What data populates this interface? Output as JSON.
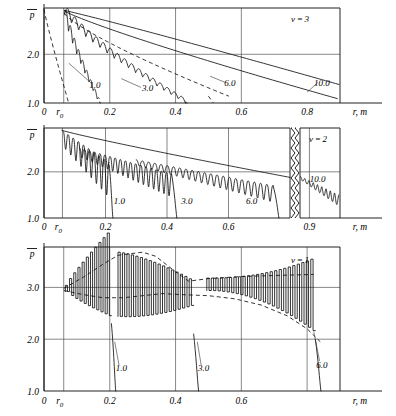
{
  "figure": {
    "type": "multi-panel-line-chart",
    "panel_count": 3,
    "shared_xlabel": "r, m",
    "shared_ylabel": "p"
  },
  "chart_data": [
    {
      "type": "line",
      "id": "panel-nu-3",
      "title": "",
      "annotation": "ν = 3",
      "xlabel": "r, m",
      "ylabel": "p",
      "xlim": [
        0,
        0.9
      ],
      "ylim": [
        1.0,
        2.9
      ],
      "grid": true,
      "legend": "inline-curve-labels",
      "xticks": [
        "0",
        "r₀",
        "0.2",
        "0.4",
        "0.6",
        "0.8"
      ],
      "xtick_values": [
        0,
        0.06,
        0.2,
        0.4,
        0.6,
        0.8
      ],
      "yticks": [
        "1.0",
        "2.0"
      ],
      "ytick_values": [
        1.0,
        2.0
      ],
      "series": [
        {
          "name": "1.0",
          "label": "1.0",
          "style": "solid-oscillating",
          "x": [
            0.06,
            0.07,
            0.08,
            0.09,
            0.1,
            0.11,
            0.12,
            0.13,
            0.14,
            0.15,
            0.16,
            0.17
          ],
          "values": [
            2.88,
            2.55,
            2.32,
            2.12,
            1.95,
            1.8,
            1.68,
            1.55,
            1.44,
            1.32,
            1.18,
            1.0
          ]
        },
        {
          "name": "3.0",
          "label": "3.0",
          "style": "solid-oscillating",
          "x": [
            0.06,
            0.1,
            0.14,
            0.18,
            0.22,
            0.26,
            0.3,
            0.34,
            0.38,
            0.42
          ],
          "values": [
            2.88,
            2.52,
            2.22,
            1.95,
            1.72,
            1.55,
            1.4,
            1.28,
            1.15,
            1.0
          ]
        },
        {
          "name": "6.0",
          "label": "6.0",
          "style": "solid",
          "x": [
            0.06,
            0.1,
            0.2,
            0.3,
            0.4,
            0.5,
            0.6,
            0.7,
            0.8,
            0.88
          ],
          "values": [
            2.88,
            2.72,
            2.46,
            2.2,
            1.96,
            1.73,
            1.52,
            1.34,
            1.18,
            1.05
          ]
        },
        {
          "name": "10.0",
          "label": "10.0",
          "style": "solid",
          "x": [
            0.06,
            0.1,
            0.2,
            0.3,
            0.4,
            0.5,
            0.6,
            0.7,
            0.8,
            0.88
          ],
          "values": [
            2.88,
            2.82,
            2.66,
            2.48,
            2.28,
            2.07,
            1.86,
            1.64,
            1.42,
            1.26
          ]
        },
        {
          "name": "envelope-left",
          "label": "",
          "style": "dashed",
          "x": [
            0.0,
            0.01,
            0.02,
            0.03,
            0.04,
            0.05,
            0.06,
            0.07
          ],
          "values": [
            2.89,
            2.6,
            2.28,
            1.96,
            1.66,
            1.38,
            1.14,
            1.0
          ]
        },
        {
          "name": "envelope-mid",
          "label": "",
          "style": "dashed",
          "x": [
            0.06,
            0.12,
            0.2,
            0.3,
            0.4,
            0.5,
            0.55
          ],
          "values": [
            2.8,
            2.4,
            2.05,
            1.7,
            1.42,
            1.22,
            1.1
          ]
        }
      ]
    },
    {
      "type": "line",
      "id": "panel-nu-2",
      "title": "",
      "annotation": "ν = 2",
      "xlabel": "r, m",
      "ylabel": "p",
      "xlim": [
        0,
        1.0
      ],
      "ylim": [
        1.0,
        2.9
      ],
      "grid": true,
      "axis_break": true,
      "axis_break_after": 0.78,
      "legend": "inline-curve-labels",
      "xticks": [
        "0",
        "r₀",
        "0.2",
        "0.4",
        "0.6",
        "0.9"
      ],
      "xtick_values": [
        0,
        0.06,
        0.2,
        0.4,
        0.6,
        0.9
      ],
      "yticks": [
        "1.0",
        "2.0"
      ],
      "ytick_values": [
        1.0,
        2.0
      ],
      "series": [
        {
          "name": "1.0",
          "label": "1.0",
          "style": "solid-oscillating",
          "x": [
            0.06,
            0.09,
            0.12,
            0.15,
            0.18,
            0.21,
            0.225
          ],
          "values": [
            2.85,
            2.6,
            2.4,
            2.2,
            2.05,
            1.9,
            1.0
          ]
        },
        {
          "name": "3.0",
          "label": "3.0",
          "style": "solid-oscillating",
          "x": [
            0.1,
            0.16,
            0.22,
            0.28,
            0.34,
            0.4,
            0.44
          ],
          "values": [
            2.5,
            2.35,
            2.2,
            2.08,
            1.96,
            1.85,
            1.0
          ]
        },
        {
          "name": "6.0",
          "label": "6.0",
          "style": "solid-oscillating",
          "x": [
            0.3,
            0.4,
            0.5,
            0.6,
            0.68,
            0.74,
            0.76
          ],
          "values": [
            2.25,
            2.12,
            2.0,
            1.86,
            1.74,
            1.62,
            1.0
          ]
        },
        {
          "name": "10.0",
          "label": "10.0",
          "style": "solid-oscillating",
          "x": [
            0.82,
            0.86,
            0.9,
            0.94,
            0.97,
            1.0
          ],
          "values": [
            1.86,
            1.8,
            1.72,
            1.62,
            1.52,
            1.4
          ]
        },
        {
          "name": "smooth-upper",
          "label": "",
          "style": "solid",
          "x": [
            0.06,
            0.2,
            0.4,
            0.6,
            0.78
          ],
          "values": [
            2.88,
            2.62,
            2.32,
            2.06,
            1.88
          ]
        }
      ]
    },
    {
      "type": "line",
      "id": "panel-nu-1",
      "title": "",
      "annotation": "ν = 1",
      "xlabel": "r, m",
      "ylabel": "p",
      "xlim": [
        0,
        0.9
      ],
      "ylim": [
        1.0,
        3.75
      ],
      "grid": true,
      "legend": "inline-curve-labels",
      "xticks": [
        "0",
        "r₀",
        "0.2",
        "0.4",
        "0.6"
      ],
      "xtick_values": [
        0,
        0.06,
        0.2,
        0.4,
        0.6
      ],
      "yticks": [
        "1.0",
        "2.0",
        "3.0"
      ],
      "ytick_values": [
        1.0,
        2.0,
        3.0
      ],
      "series": [
        {
          "name": "1.0",
          "label": "1.0",
          "style": "square-oscillating",
          "x": [
            0.07,
            0.1,
            0.13,
            0.16,
            0.19,
            0.215
          ],
          "values": [
            3.1,
            3.35,
            3.6,
            3.7,
            3.5,
            1.0
          ],
          "amplitude": [
            0.15,
            0.45,
            0.75,
            0.78,
            0.6,
            0
          ]
        },
        {
          "name": "3.0",
          "label": "3.0",
          "style": "square-oscillating",
          "x": [
            0.23,
            0.28,
            0.33,
            0.38,
            0.43,
            0.47
          ],
          "values": [
            3.4,
            3.6,
            3.5,
            3.2,
            2.8,
            1.0
          ],
          "amplitude": [
            0.55,
            0.72,
            0.62,
            0.45,
            0.3,
            0
          ]
        },
        {
          "name": "6.0",
          "label": "6.0",
          "style": "square-oscillating",
          "x": [
            0.52,
            0.6,
            0.68,
            0.74,
            0.8,
            0.84
          ],
          "values": [
            3.1,
            3.12,
            3.1,
            3.0,
            2.8,
            1.0
          ],
          "amplitude": [
            0.18,
            0.22,
            0.3,
            0.42,
            0.75,
            0
          ]
        },
        {
          "name": "envelope-upper",
          "label": "",
          "style": "dashed",
          "x": [
            0.06,
            0.14,
            0.22,
            0.3,
            0.4,
            0.55,
            0.7,
            0.82
          ],
          "values": [
            2.98,
            3.3,
            3.6,
            3.18,
            3.16,
            3.22,
            3.22,
            3.24
          ]
        },
        {
          "name": "envelope-lower",
          "label": "",
          "style": "dashed",
          "x": [
            0.06,
            0.14,
            0.22,
            0.3,
            0.4,
            0.55,
            0.7,
            0.82
          ],
          "values": [
            2.92,
            2.82,
            2.78,
            2.9,
            2.86,
            2.8,
            2.55,
            2.05
          ]
        }
      ]
    }
  ],
  "panels": [
    {
      "name": "nu-3",
      "nu_label": "ν = 3",
      "y_axis_symbol": "p",
      "x_axis_label": "r, m",
      "xticks": [
        {
          "label": "0",
          "x": 0
        },
        {
          "label": "r",
          "sub": "0",
          "x": 0.06
        },
        {
          "label": "0.2",
          "x": 0.2
        },
        {
          "label": "0.4",
          "x": 0.4
        },
        {
          "label": "0.6",
          "x": 0.6
        },
        {
          "label": "0.8",
          "x": 0.8
        }
      ],
      "yticks": [
        {
          "label": "2.0",
          "y": 2.0
        },
        {
          "label": "1.0",
          "y": 1.0
        }
      ],
      "curve_labels": [
        {
          "text": "1.0",
          "x": 0.155,
          "y": 1.3
        },
        {
          "text": "3.0",
          "x": 0.315,
          "y": 1.24
        },
        {
          "text": "6.0",
          "x": 0.565,
          "y": 1.35
        },
        {
          "text": "10.0",
          "x": 0.845,
          "y": 1.34
        }
      ]
    },
    {
      "name": "nu-2",
      "nu_label": "ν = 2",
      "y_axis_symbol": "p",
      "x_axis_label": "r, m",
      "xticks": [
        {
          "label": "0",
          "x": 0
        },
        {
          "label": "r",
          "sub": "0",
          "x": 0.06
        },
        {
          "label": "0.2",
          "x": 0.2
        },
        {
          "label": "0.4",
          "x": 0.4
        },
        {
          "label": "0.6",
          "x": 0.6
        },
        {
          "label": "0.9",
          "x": 0.9
        }
      ],
      "yticks": [
        {
          "label": "2.0",
          "y": 2.0
        },
        {
          "label": "1.0",
          "y": 1.0
        }
      ],
      "curve_labels": [
        {
          "text": "1.0",
          "x": 0.245,
          "y": 1.3
        },
        {
          "text": "3.0",
          "x": 0.465,
          "y": 1.3
        },
        {
          "text": "6.0",
          "x": 0.675,
          "y": 1.3
        },
        {
          "text": "10.0",
          "x": 0.935,
          "y": 1.78
        }
      ]
    },
    {
      "name": "nu-1",
      "nu_label": "ν = 1",
      "y_axis_symbol": "p",
      "x_axis_label": "r, m",
      "xticks": [
        {
          "label": "0",
          "x": 0
        },
        {
          "label": "r",
          "sub": "0",
          "x": 0.06
        },
        {
          "label": "0.2",
          "x": 0.2
        },
        {
          "label": "0.4",
          "x": 0.4
        },
        {
          "label": "0.6",
          "x": 0.6
        }
      ],
      "yticks": [
        {
          "label": "3.0",
          "y": 3.0
        },
        {
          "label": "2.0",
          "y": 2.0
        },
        {
          "label": "1.0",
          "y": 1.0
        }
      ],
      "curve_labels": [
        {
          "text": "1.0",
          "x": 0.235,
          "y": 1.38
        },
        {
          "text": "3.0",
          "x": 0.485,
          "y": 1.38
        },
        {
          "text": "6.0",
          "x": 0.845,
          "y": 1.45
        }
      ]
    }
  ],
  "colors": {
    "ink": "#111111",
    "grid": "#555555",
    "frame": "#222222",
    "background": "#ffffff"
  }
}
